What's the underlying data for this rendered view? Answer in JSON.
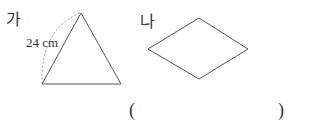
{
  "figures": [
    {
      "label": "가",
      "shape": "equilateral-triangle",
      "side_label": "24 cm"
    },
    {
      "label": "나",
      "shape": "rhombus"
    }
  ],
  "answer": {
    "open": "(",
    "close": ")",
    "value": ""
  },
  "colors": {
    "line": "#555555",
    "text": "#333333"
  }
}
